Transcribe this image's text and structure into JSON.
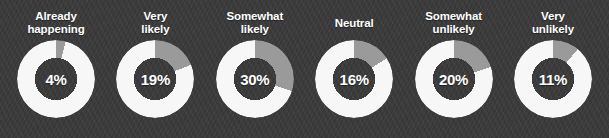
{
  "colors": {
    "background": "#3b3b3b",
    "ring_base": "#f7f7f7",
    "ring_segment": "#9a9a9a",
    "label_text": "#ffffff",
    "value_text": "#ffffff"
  },
  "chart_data": {
    "type": "pie",
    "title": "",
    "subtitle": "",
    "xlabel": "",
    "ylabel": "",
    "legend_position": "none",
    "grid": false,
    "unit": "%",
    "segment_start_angle_deg": 0,
    "segment_direction": "clockwise",
    "categories": [
      "Already\nhappening",
      "Very\nlikely",
      "Somewhat\nlikely",
      "Neutral",
      "Somewhat\nunlikely",
      "Very\nunlikely"
    ],
    "values": [
      4,
      19,
      30,
      16,
      20,
      11
    ],
    "value_labels": [
      "4%",
      "19%",
      "30%",
      "16%",
      "20%",
      "11%"
    ]
  },
  "donuts": [
    {
      "label": "Already\nhappening",
      "value": 4,
      "value_label": "4%"
    },
    {
      "label": "Very\nlikely",
      "value": 19,
      "value_label": "19%"
    },
    {
      "label": "Somewhat\nlikely",
      "value": 30,
      "value_label": "30%"
    },
    {
      "label": "Neutral",
      "value": 16,
      "value_label": "16%"
    },
    {
      "label": "Somewhat\nunlikely",
      "value": 20,
      "value_label": "20%"
    },
    {
      "label": "Very\nunlikely",
      "value": 11,
      "value_label": "11%"
    }
  ]
}
